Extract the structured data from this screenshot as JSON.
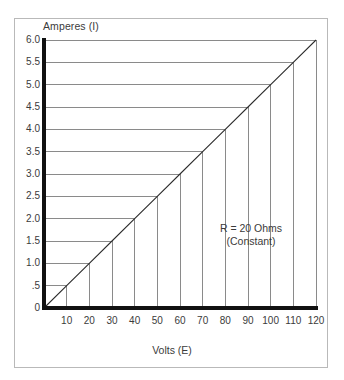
{
  "chart_data": {
    "type": "line",
    "title": "",
    "xlabel": "Volts (E)",
    "ylabel": "Amperes (I)",
    "xlim": [
      0,
      120
    ],
    "ylim": [
      0,
      6.0
    ],
    "grid": true,
    "legend": "none",
    "annotations": [
      {
        "text_line1": "R = 20 Ohms",
        "text_line2": "(Constant)",
        "x": 90,
        "y": 2.2
      }
    ],
    "x_tick_values": [
      10,
      20,
      30,
      40,
      50,
      60,
      70,
      80,
      90,
      100,
      110,
      120
    ],
    "x_tick_labels": [
      "10",
      "20",
      "30",
      "40",
      "50",
      "60",
      "70",
      "80",
      "90",
      "100",
      "110",
      "120"
    ],
    "y_tick_values": [
      6.0,
      5.5,
      5.0,
      4.5,
      4.0,
      3.5,
      3.0,
      2.5,
      2.0,
      1.5,
      1.0,
      0.5,
      0
    ],
    "y_tick_labels": [
      "6.0",
      "5.5",
      "5.0",
      "4.5",
      "4.0",
      "3.5",
      "3.0",
      "2.5",
      "2.0",
      "1.5",
      "1.0",
      ".5",
      "0"
    ],
    "series": [
      {
        "name": "I = E / R (R = 20 Ohms)",
        "x": [
          0,
          10,
          20,
          30,
          40,
          50,
          60,
          70,
          80,
          90,
          100,
          110,
          120
        ],
        "values": [
          0,
          0.5,
          1.0,
          1.5,
          2.0,
          2.5,
          3.0,
          3.5,
          4.0,
          4.5,
          5.0,
          5.5,
          6.0
        ]
      }
    ],
    "guide_points": [
      {
        "volts": 10,
        "amperes": 0.5
      },
      {
        "volts": 20,
        "amperes": 1.0
      },
      {
        "volts": 30,
        "amperes": 1.5
      },
      {
        "volts": 40,
        "amperes": 2.0
      },
      {
        "volts": 50,
        "amperes": 2.5
      },
      {
        "volts": 60,
        "amperes": 3.0
      },
      {
        "volts": 70,
        "amperes": 3.5
      },
      {
        "volts": 80,
        "amperes": 4.0
      },
      {
        "volts": 90,
        "amperes": 4.5
      },
      {
        "volts": 100,
        "amperes": 5.0
      },
      {
        "volts": 110,
        "amperes": 5.5
      },
      {
        "volts": 120,
        "amperes": 6.0
      }
    ],
    "colors": {
      "axis": "#111111",
      "gridline": "#8a8a8a",
      "data_line": "#2b2b2b",
      "text": "#3b3b3b",
      "frame": "#b9b9b9",
      "background": "#ffffff"
    }
  }
}
